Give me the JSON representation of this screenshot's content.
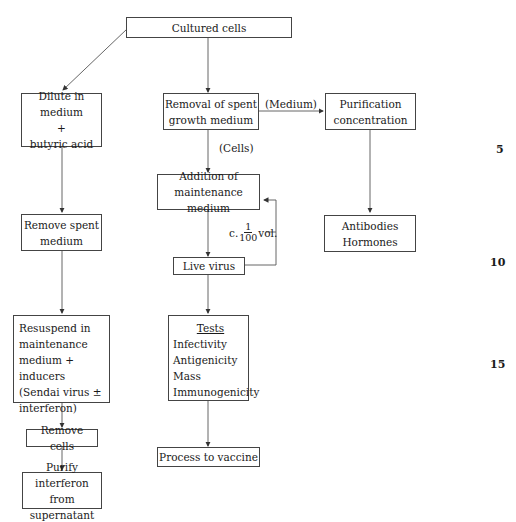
{
  "diagram": {
    "nodes": {
      "cultured_cells": {
        "lines": [
          "Cultured cells"
        ]
      },
      "dilute": {
        "lines": [
          "Dilute in medium",
          "+",
          "butyric acid"
        ]
      },
      "removal": {
        "lines": [
          "Removal of spent",
          "growth medium"
        ]
      },
      "purification": {
        "lines": [
          "Purification",
          "concentration"
        ]
      },
      "addition": {
        "lines": [
          "Addition of",
          "maintenance medium"
        ]
      },
      "antibodies": {
        "lines": [
          "Antibodies",
          "Hormones"
        ]
      },
      "remove_spent": {
        "lines": [
          "Remove spent",
          "medium"
        ]
      },
      "live_virus": {
        "lines": [
          "Live virus"
        ]
      },
      "resuspend": {
        "lines": [
          "Resuspend in",
          "maintenance",
          "medium + inducers",
          "(Sendai virus ±",
          "interferon)"
        ]
      },
      "tests": {
        "title": "Tests",
        "lines": [
          "Infectivity",
          "Antigenicity",
          "Mass",
          "Immunogenicity"
        ]
      },
      "remove_cells": {
        "lines": [
          "Remove cells"
        ]
      },
      "process_vaccine": {
        "lines": [
          "Process to vaccine"
        ]
      },
      "purify_interferon": {
        "lines": [
          "Purify interferon",
          "from supernatant"
        ]
      }
    },
    "edge_labels": {
      "medium": "(Medium)",
      "cells": "(Cells)",
      "loop_prefix": "c.",
      "loop_num": "1",
      "loop_den": "100",
      "loop_suffix": "vol."
    },
    "line_numbers": [
      "5",
      "10",
      "15"
    ]
  }
}
